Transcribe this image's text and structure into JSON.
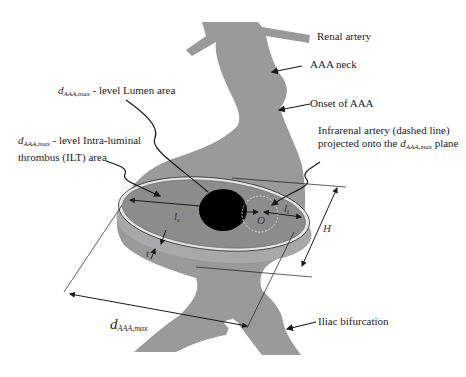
{
  "diagram": {
    "labels": {
      "renal_artery": "Renal artery",
      "aaa_neck": "AAA neck",
      "onset_of_aaa": "Onset of AAA",
      "infrarenal_line1": "Infrarenal artery (dashed line)",
      "infrarenal_line2_prefix": "projected onto the ",
      "infrarenal_line2_suffix": " plane",
      "lumen_area_suffix": " - level Lumen area",
      "ilt_line1_suffix": " - level Intra-luminal",
      "ilt_line2": "thrombus (ILT) area",
      "iliac_bifurcation": "Iliac bifurcation",
      "d_symbol": "d",
      "d_subscript_max": "AAA,max",
      "d_subscript_bottom": "AAA,max"
    },
    "symbols": {
      "l_e": "l",
      "l_e_sub": "e",
      "l_i": "l",
      "l_i_sub": "i",
      "O": "O",
      "H": "H",
      "t": "t"
    },
    "colors": {
      "vessel": "#9a9a9a",
      "ilt_disc": "#8c8c8c",
      "ring": "#e6e6e6",
      "lumen": "#000000",
      "lines": "#1a1a1a",
      "dashed_circle": "#d8d8d8",
      "background": "#ffffff"
    }
  }
}
